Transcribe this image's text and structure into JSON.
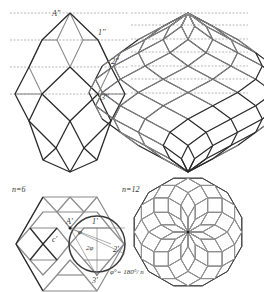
{
  "figure": {
    "panels": [
      {
        "id": "elevation-n6",
        "description": "Front elevation of rhombic zonohedron, n=6"
      },
      {
        "id": "elevation-n12",
        "description": "Front elevation of polar zonohedron, n=12"
      },
      {
        "id": "plan-n6",
        "description": "Plan view, n=6"
      },
      {
        "id": "plan-n12",
        "description": "Plan view, n=12"
      }
    ],
    "labels": {
      "A2": "A''",
      "p1_2": "1''",
      "p2_2": "2''",
      "p3_2": "3''",
      "n6": "n=6",
      "n12": "n=12",
      "A1": "A'",
      "p1_1": "1'",
      "p2_1": "2'",
      "p3_1": "3'",
      "c1": "c'",
      "phi": "φ",
      "two_phi": "2φ",
      "formula": "φ°= 180°/ n"
    },
    "colors": {
      "dark_line": "#2a2a2a",
      "light_line": "#8a8a8a",
      "dashed": "#777777",
      "background": "#ffffff"
    }
  }
}
